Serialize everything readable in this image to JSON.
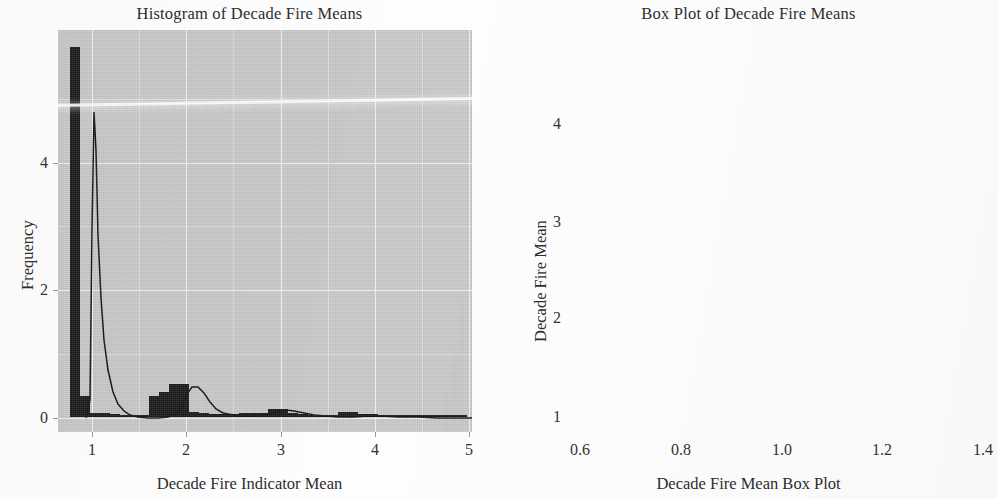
{
  "figure": {
    "background_color": "#fdfdfd",
    "axes_background_color": "#c9c9c9",
    "grid_color": "#f3f3f3",
    "ink_color": "#1b1b1b"
  },
  "panels": [
    {
      "id": "histogram",
      "title": "Histogram of Decade Fire Means",
      "xlabel": "Decade Fire Indicator Mean",
      "ylabel": "Frequency",
      "x_ticklabels": [
        "1",
        "2",
        "3",
        "4",
        "5"
      ],
      "y_ticklabels": [
        "0",
        "2",
        "4"
      ]
    },
    {
      "id": "boxplot",
      "title": "Box Plot of Decade Fire Means",
      "xlabel": "Decade Fire Mean Box Plot",
      "ylabel": "Decade Fire Mean",
      "x_ticklabels": [
        "0.6",
        "0.8",
        "1.0",
        "1.2",
        "1.4"
      ],
      "y_ticklabels": [
        "1",
        "2",
        "3",
        "4"
      ]
    }
  ],
  "chart_data": [
    {
      "type": "histogram",
      "title": "Histogram of Decade Fire Means",
      "xlabel": "Decade Fire Indicator Mean",
      "ylabel": "Frequency",
      "xlim": [
        0.88,
        5.05
      ],
      "ylim": [
        -0.22,
        5.6
      ],
      "xticks": [
        1,
        2,
        3,
        4,
        5
      ],
      "yticks": [
        0,
        2,
        4
      ],
      "grid": true,
      "bin_width": 0.1,
      "bin_left_edges": [
        1.0,
        1.1,
        1.2,
        1.3,
        1.4,
        1.5,
        1.6,
        1.7,
        1.8,
        1.9,
        2.0,
        2.1,
        2.2,
        2.3,
        2.4,
        2.5,
        2.6,
        2.7,
        2.8,
        2.9,
        3.0,
        3.1,
        3.2,
        3.3,
        3.4,
        3.5,
        3.6,
        3.7,
        3.8,
        3.9,
        4.0,
        4.1,
        4.2,
        4.3,
        4.4,
        4.5,
        4.6,
        4.7,
        4.8,
        4.9
      ],
      "values": [
        5.35,
        0.3,
        0.05,
        0.05,
        0.04,
        0.03,
        0.03,
        0.03,
        0.3,
        0.36,
        0.47,
        0.47,
        0.07,
        0.05,
        0.04,
        0.04,
        0.04,
        0.05,
        0.05,
        0.06,
        0.12,
        0.12,
        0.05,
        0.04,
        0.03,
        0.03,
        0.03,
        0.07,
        0.07,
        0.04,
        0.04,
        0.03,
        0.03,
        0.03,
        0.03,
        0.03,
        0.03,
        0.03,
        0.03,
        0.03
      ],
      "kde_overlay": true,
      "kde_description": "Smooth density curve peaking sharply above the first bin near x=1, dipping to near zero around x=1.6, a secondary bump near x=2.05, then a long flat tail to x=5"
    },
    {
      "type": "box",
      "title": "Box Plot of Decade Fire Means",
      "xlabel": "Decade Fire Mean Box Plot",
      "ylabel": "Decade Fire Mean",
      "xlim": [
        0.58,
        1.42
      ],
      "ylim": [
        0.62,
        4.92
      ],
      "xticks": [
        0.6,
        0.8,
        1.0,
        1.2,
        1.4
      ],
      "yticks": [
        1,
        2,
        3,
        4
      ],
      "grid": true,
      "orientation": "vertical",
      "box_center_x": 1.0,
      "box_half_width": 0.375,
      "q1": 1.0,
      "median": 1.0,
      "q3": 1.5,
      "whisker_low": 1.0,
      "whisker_high": 1.5,
      "outliers": [
        1.6,
        1.68,
        1.76,
        1.84,
        1.92,
        2.0,
        2.08,
        2.16,
        2.24,
        2.32,
        2.4,
        2.5,
        2.6,
        2.7,
        2.8,
        2.9,
        3.0,
        3.1,
        3.2,
        3.32,
        3.44,
        3.56,
        3.68,
        3.8,
        3.92,
        4.05,
        4.72
      ]
    }
  ]
}
